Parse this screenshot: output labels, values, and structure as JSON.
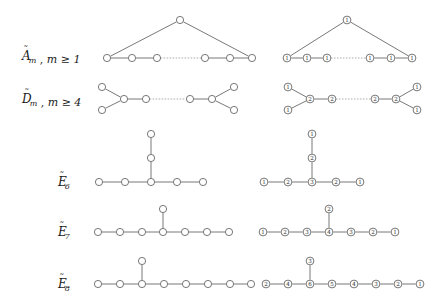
{
  "figure": {
    "background_color": "#ffffff",
    "node_stroke_color": "#555555",
    "node_fill_color": "#ffffff",
    "edge_color": "#555555",
    "dotted_edge_color": "#999999",
    "text_color": "#1a1a1a"
  },
  "rows": [
    {
      "id": "A-tilde",
      "label": "Ãₘ ,  m ≥ 1",
      "label_base": "A",
      "label_sub": "m",
      "condition": "m ≥ 1",
      "unlabeled": {
        "nodes": [
          {
            "id": "a0",
            "x": 180,
            "y": 20,
            "mark": "1"
          },
          {
            "id": "a1",
            "x": 107,
            "y": 58,
            "mark": "1"
          },
          {
            "id": "a2",
            "x": 132,
            "y": 58,
            "mark": "1"
          },
          {
            "id": "a3",
            "x": 157,
            "y": 58,
            "mark": "1"
          },
          {
            "id": "a4",
            "x": 205,
            "y": 58,
            "mark": "1"
          },
          {
            "id": "a5",
            "x": 230,
            "y": 58,
            "mark": "1"
          },
          {
            "id": "a6",
            "x": 252,
            "y": 58,
            "mark": "1"
          }
        ],
        "edges": [
          {
            "from": "a0",
            "to": "a1",
            "style": "solid"
          },
          {
            "from": "a0",
            "to": "a6",
            "style": "solid"
          },
          {
            "from": "a1",
            "to": "a2",
            "style": "solid"
          },
          {
            "from": "a2",
            "to": "a3",
            "style": "solid"
          },
          {
            "from": "a3",
            "to": "a4",
            "style": "dotted"
          },
          {
            "from": "a4",
            "to": "a5",
            "style": "solid"
          },
          {
            "from": "a5",
            "to": "a6",
            "style": "solid"
          }
        ]
      },
      "labeled": {
        "nodes": [
          {
            "id": "b0",
            "x": 347,
            "y": 20,
            "mark": "1"
          },
          {
            "id": "b1",
            "x": 287,
            "y": 58,
            "mark": "1"
          },
          {
            "id": "b2",
            "x": 307,
            "y": 58,
            "mark": "1"
          },
          {
            "id": "b3",
            "x": 327,
            "y": 58,
            "mark": "1"
          },
          {
            "id": "b4",
            "x": 370,
            "y": 58,
            "mark": "1"
          },
          {
            "id": "b5",
            "x": 391,
            "y": 58,
            "mark": "1"
          },
          {
            "id": "b6",
            "x": 412,
            "y": 58,
            "mark": "1"
          }
        ],
        "edges": [
          {
            "from": "b0",
            "to": "b1",
            "style": "solid"
          },
          {
            "from": "b0",
            "to": "b6",
            "style": "solid"
          },
          {
            "from": "b1",
            "to": "b2",
            "style": "solid"
          },
          {
            "from": "b2",
            "to": "b3",
            "style": "solid"
          },
          {
            "from": "b3",
            "to": "b4",
            "style": "dotted"
          },
          {
            "from": "b4",
            "to": "b5",
            "style": "solid"
          },
          {
            "from": "b5",
            "to": "b6",
            "style": "solid"
          }
        ]
      }
    },
    {
      "id": "D-tilde",
      "label": "D̃ₘ ,  m ≥ 4",
      "label_base": "D",
      "label_sub": "m",
      "condition": "m ≥ 4",
      "unlabeled": {
        "nodes": [
          {
            "id": "c0",
            "x": 102,
            "y": 87,
            "mark": "1"
          },
          {
            "id": "c1",
            "x": 102,
            "y": 110,
            "mark": "1"
          },
          {
            "id": "c2",
            "x": 124,
            "y": 99,
            "mark": "2"
          },
          {
            "id": "c3",
            "x": 146,
            "y": 99,
            "mark": "2"
          },
          {
            "id": "c4",
            "x": 190,
            "y": 99,
            "mark": "2"
          },
          {
            "id": "c5",
            "x": 212,
            "y": 99,
            "mark": "2"
          },
          {
            "id": "c6",
            "x": 234,
            "y": 87,
            "mark": "1"
          },
          {
            "id": "c7",
            "x": 234,
            "y": 110,
            "mark": "1"
          }
        ],
        "edges": [
          {
            "from": "c0",
            "to": "c2",
            "style": "solid"
          },
          {
            "from": "c1",
            "to": "c2",
            "style": "solid"
          },
          {
            "from": "c2",
            "to": "c3",
            "style": "solid"
          },
          {
            "from": "c3",
            "to": "c4",
            "style": "dotted"
          },
          {
            "from": "c4",
            "to": "c5",
            "style": "solid"
          },
          {
            "from": "c5",
            "to": "c6",
            "style": "solid"
          },
          {
            "from": "c5",
            "to": "c7",
            "style": "solid"
          }
        ]
      },
      "labeled": {
        "nodes": [
          {
            "id": "d0",
            "x": 288,
            "y": 87,
            "mark": "1"
          },
          {
            "id": "d1",
            "x": 288,
            "y": 110,
            "mark": "1"
          },
          {
            "id": "d2",
            "x": 310,
            "y": 99,
            "mark": "2"
          },
          {
            "id": "d3",
            "x": 332,
            "y": 99,
            "mark": "2"
          },
          {
            "id": "d4",
            "x": 375,
            "y": 99,
            "mark": "2"
          },
          {
            "id": "d5",
            "x": 396,
            "y": 99,
            "mark": "2"
          },
          {
            "id": "d6",
            "x": 417,
            "y": 87,
            "mark": "1"
          },
          {
            "id": "d7",
            "x": 417,
            "y": 110,
            "mark": "1"
          }
        ],
        "edges": [
          {
            "from": "d0",
            "to": "d2",
            "style": "solid"
          },
          {
            "from": "d1",
            "to": "d2",
            "style": "solid"
          },
          {
            "from": "d2",
            "to": "d3",
            "style": "solid"
          },
          {
            "from": "d3",
            "to": "d4",
            "style": "dotted"
          },
          {
            "from": "d4",
            "to": "d5",
            "style": "solid"
          },
          {
            "from": "d5",
            "to": "d6",
            "style": "solid"
          },
          {
            "from": "d5",
            "to": "d7",
            "style": "solid"
          }
        ]
      }
    },
    {
      "id": "E6-tilde",
      "label": "Ẽ₆",
      "label_base": "E",
      "label_sub": "6",
      "condition": "",
      "unlabeled": {
        "nodes": [
          {
            "id": "e0",
            "x": 99,
            "y": 182,
            "mark": "1"
          },
          {
            "id": "e1",
            "x": 125,
            "y": 182,
            "mark": "2"
          },
          {
            "id": "e2",
            "x": 151,
            "y": 182,
            "mark": "3"
          },
          {
            "id": "e3",
            "x": 177,
            "y": 182,
            "mark": "2"
          },
          {
            "id": "e4",
            "x": 203,
            "y": 182,
            "mark": "1"
          },
          {
            "id": "e5",
            "x": 151,
            "y": 158,
            "mark": "2"
          },
          {
            "id": "e6",
            "x": 151,
            "y": 134,
            "mark": "1"
          }
        ],
        "edges": [
          {
            "from": "e0",
            "to": "e1",
            "style": "solid"
          },
          {
            "from": "e1",
            "to": "e2",
            "style": "solid"
          },
          {
            "from": "e2",
            "to": "e3",
            "style": "solid"
          },
          {
            "from": "e3",
            "to": "e4",
            "style": "solid"
          },
          {
            "from": "e2",
            "to": "e5",
            "style": "solid"
          },
          {
            "from": "e5",
            "to": "e6",
            "style": "solid"
          }
        ]
      },
      "labeled": {
        "nodes": [
          {
            "id": "f0",
            "x": 264,
            "y": 182,
            "mark": "1"
          },
          {
            "id": "f1",
            "x": 288,
            "y": 182,
            "mark": "2"
          },
          {
            "id": "f2",
            "x": 312,
            "y": 182,
            "mark": "3"
          },
          {
            "id": "f3",
            "x": 336,
            "y": 182,
            "mark": "2"
          },
          {
            "id": "f4",
            "x": 360,
            "y": 182,
            "mark": "1"
          },
          {
            "id": "f5",
            "x": 312,
            "y": 158,
            "mark": "2"
          },
          {
            "id": "f6",
            "x": 312,
            "y": 134,
            "mark": "1"
          }
        ],
        "edges": [
          {
            "from": "f0",
            "to": "f1",
            "style": "solid"
          },
          {
            "from": "f1",
            "to": "f2",
            "style": "solid"
          },
          {
            "from": "f2",
            "to": "f3",
            "style": "solid"
          },
          {
            "from": "f3",
            "to": "f4",
            "style": "solid"
          },
          {
            "from": "f2",
            "to": "f5",
            "style": "solid"
          },
          {
            "from": "f5",
            "to": "f6",
            "style": "solid"
          }
        ]
      }
    },
    {
      "id": "E7-tilde",
      "label": "Ẽ₇",
      "label_base": "E",
      "label_sub": "7",
      "condition": "",
      "unlabeled": {
        "nodes": [
          {
            "id": "g0",
            "x": 98,
            "y": 232,
            "mark": "1"
          },
          {
            "id": "g1",
            "x": 120,
            "y": 232,
            "mark": "2"
          },
          {
            "id": "g2",
            "x": 142,
            "y": 232,
            "mark": "3"
          },
          {
            "id": "g3",
            "x": 163,
            "y": 232,
            "mark": "4"
          },
          {
            "id": "g4",
            "x": 185,
            "y": 232,
            "mark": "3"
          },
          {
            "id": "g5",
            "x": 207,
            "y": 232,
            "mark": "2"
          },
          {
            "id": "g6",
            "x": 229,
            "y": 232,
            "mark": "1"
          },
          {
            "id": "g7",
            "x": 163,
            "y": 209,
            "mark": "2"
          }
        ],
        "edges": [
          {
            "from": "g0",
            "to": "g1",
            "style": "solid"
          },
          {
            "from": "g1",
            "to": "g2",
            "style": "solid"
          },
          {
            "from": "g2",
            "to": "g3",
            "style": "solid"
          },
          {
            "from": "g3",
            "to": "g4",
            "style": "solid"
          },
          {
            "from": "g4",
            "to": "g5",
            "style": "solid"
          },
          {
            "from": "g5",
            "to": "g6",
            "style": "solid"
          },
          {
            "from": "g3",
            "to": "g7",
            "style": "solid"
          }
        ]
      },
      "labeled": {
        "nodes": [
          {
            "id": "h0",
            "x": 263,
            "y": 232,
            "mark": "1"
          },
          {
            "id": "h1",
            "x": 285,
            "y": 232,
            "mark": "2"
          },
          {
            "id": "h2",
            "x": 307,
            "y": 232,
            "mark": "3"
          },
          {
            "id": "h3",
            "x": 329,
            "y": 232,
            "mark": "4"
          },
          {
            "id": "h4",
            "x": 351,
            "y": 232,
            "mark": "3"
          },
          {
            "id": "h5",
            "x": 373,
            "y": 232,
            "mark": "2"
          },
          {
            "id": "h6",
            "x": 395,
            "y": 232,
            "mark": "1"
          },
          {
            "id": "h7",
            "x": 329,
            "y": 209,
            "mark": "2"
          }
        ],
        "edges": [
          {
            "from": "h0",
            "to": "h1",
            "style": "solid"
          },
          {
            "from": "h1",
            "to": "h2",
            "style": "solid"
          },
          {
            "from": "h2",
            "to": "h3",
            "style": "solid"
          },
          {
            "from": "h3",
            "to": "h4",
            "style": "solid"
          },
          {
            "from": "h4",
            "to": "h5",
            "style": "solid"
          },
          {
            "from": "h5",
            "to": "h6",
            "style": "solid"
          },
          {
            "from": "h3",
            "to": "h7",
            "style": "solid"
          }
        ]
      }
    },
    {
      "id": "E8-tilde",
      "label": "Ẽ₈",
      "label_base": "E",
      "label_sub": "8",
      "condition": "",
      "unlabeled": {
        "nodes": [
          {
            "id": "i0",
            "x": 98,
            "y": 284,
            "mark": "2"
          },
          {
            "id": "i1",
            "x": 120,
            "y": 284,
            "mark": "4"
          },
          {
            "id": "i2",
            "x": 142,
            "y": 284,
            "mark": "6"
          },
          {
            "id": "i3",
            "x": 164,
            "y": 284,
            "mark": "5"
          },
          {
            "id": "i4",
            "x": 186,
            "y": 284,
            "mark": "4"
          },
          {
            "id": "i5",
            "x": 208,
            "y": 284,
            "mark": "3"
          },
          {
            "id": "i6",
            "x": 230,
            "y": 284,
            "mark": "2"
          },
          {
            "id": "i7",
            "x": 251,
            "y": 284,
            "mark": "1"
          },
          {
            "id": "i8",
            "x": 142,
            "y": 261,
            "mark": "3"
          }
        ],
        "edges": [
          {
            "from": "i0",
            "to": "i1",
            "style": "solid"
          },
          {
            "from": "i1",
            "to": "i2",
            "style": "solid"
          },
          {
            "from": "i2",
            "to": "i3",
            "style": "solid"
          },
          {
            "from": "i3",
            "to": "i4",
            "style": "solid"
          },
          {
            "from": "i4",
            "to": "i5",
            "style": "solid"
          },
          {
            "from": "i5",
            "to": "i6",
            "style": "solid"
          },
          {
            "from": "i6",
            "to": "i7",
            "style": "solid"
          },
          {
            "from": "i2",
            "to": "i8",
            "style": "solid"
          }
        ]
      },
      "labeled": {
        "nodes": [
          {
            "id": "j0",
            "x": 266,
            "y": 284,
            "mark": "2"
          },
          {
            "id": "j1",
            "x": 288,
            "y": 284,
            "mark": "4"
          },
          {
            "id": "j2",
            "x": 310,
            "y": 284,
            "mark": "6"
          },
          {
            "id": "j3",
            "x": 332,
            "y": 284,
            "mark": "5"
          },
          {
            "id": "j4",
            "x": 354,
            "y": 284,
            "mark": "4"
          },
          {
            "id": "j5",
            "x": 376,
            "y": 284,
            "mark": "3"
          },
          {
            "id": "j6",
            "x": 398,
            "y": 284,
            "mark": "2"
          },
          {
            "id": "j7",
            "x": 420,
            "y": 284,
            "mark": "1"
          },
          {
            "id": "j8",
            "x": 310,
            "y": 261,
            "mark": "3"
          }
        ],
        "edges": [
          {
            "from": "j0",
            "to": "j1",
            "style": "solid"
          },
          {
            "from": "j1",
            "to": "j2",
            "style": "solid"
          },
          {
            "from": "j2",
            "to": "j3",
            "style": "solid"
          },
          {
            "from": "j3",
            "to": "j4",
            "style": "solid"
          },
          {
            "from": "j4",
            "to": "j5",
            "style": "solid"
          },
          {
            "from": "j5",
            "to": "j6",
            "style": "solid"
          },
          {
            "from": "j6",
            "to": "j7",
            "style": "solid"
          },
          {
            "from": "j2",
            "to": "j8",
            "style": "solid"
          }
        ]
      }
    }
  ],
  "label_positions": [
    {
      "row": "A-tilde",
      "x": 22,
      "y": 60
    },
    {
      "row": "D-tilde",
      "x": 22,
      "y": 103
    },
    {
      "row": "E6-tilde",
      "x": 58,
      "y": 186
    },
    {
      "row": "E7-tilde",
      "x": 58,
      "y": 236
    },
    {
      "row": "E8-tilde",
      "x": 58,
      "y": 288
    }
  ]
}
